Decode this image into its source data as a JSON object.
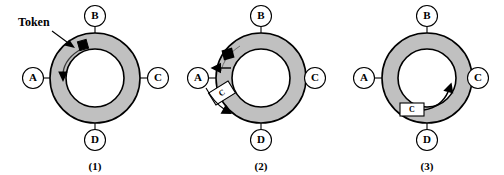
{
  "figure": {
    "background_color": "#ffffff",
    "ring_fill_color": "#c0c0c0",
    "ring_stroke_color": "#000000",
    "token_color": "#000000",
    "frame_fill_color": "#ffffff",
    "nodes": [
      "A",
      "B",
      "C",
      "D"
    ],
    "annotations": {
      "token_label": "Token"
    },
    "panels": [
      {
        "caption": "(1)",
        "nodes": [
          {
            "id": "A",
            "label": "A",
            "position": "left"
          },
          {
            "id": "B",
            "label": "B",
            "position": "top"
          },
          {
            "id": "C",
            "label": "C",
            "position": "right"
          },
          {
            "id": "D",
            "label": "D",
            "position": "bottom"
          }
        ],
        "token_present": true,
        "token_label": "Token",
        "frame_present": false,
        "frame_label": "",
        "direction_arrow": "counterclockwise-left"
      },
      {
        "caption": "(2)",
        "nodes": [
          {
            "id": "A",
            "label": "A",
            "position": "left"
          },
          {
            "id": "B",
            "label": "B",
            "position": "top"
          },
          {
            "id": "C",
            "label": "C",
            "position": "right"
          },
          {
            "id": "D",
            "label": "D",
            "position": "bottom"
          }
        ],
        "token_present": true,
        "token_label": "",
        "frame_present": true,
        "frame_label": "C",
        "direction_arrow": "a-emits-frame"
      },
      {
        "caption": "(3)",
        "nodes": [
          {
            "id": "A",
            "label": "A",
            "position": "left"
          },
          {
            "id": "B",
            "label": "B",
            "position": "top"
          },
          {
            "id": "C",
            "label": "C",
            "position": "right"
          },
          {
            "id": "D",
            "label": "D",
            "position": "bottom"
          }
        ],
        "token_present": false,
        "token_label": "",
        "frame_present": true,
        "frame_label": "C",
        "direction_arrow": "frame-travels-to-c"
      }
    ]
  }
}
